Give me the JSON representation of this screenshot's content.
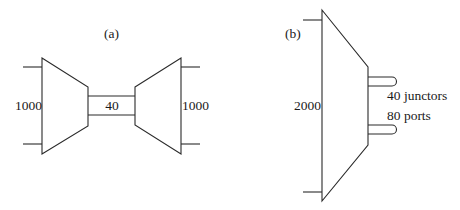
{
  "diagram": {
    "panel_a": {
      "label": "(a)",
      "left_switch_label": "1000",
      "middle_link_label": "40",
      "right_switch_label": "1000"
    },
    "panel_b": {
      "label": "(b)",
      "switch_label": "2000",
      "junctors_label": "40 junctors",
      "ports_label": "80 ports"
    },
    "colors": {
      "line": "#2a2a2a",
      "text": "#1a1a1a",
      "background": "#ffffff"
    }
  }
}
